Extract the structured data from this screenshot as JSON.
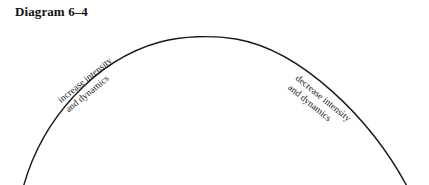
{
  "figure": {
    "title": "Diagram 6–4",
    "background_color": "#ffffff",
    "stroke_color": "#1a1a1a",
    "text_color": "#111111"
  },
  "arc": {
    "shape": "arch-curve",
    "left_end": {
      "x": 22,
      "y": 185
    },
    "apex": {
      "x": 216,
      "y": 37
    },
    "right_end": {
      "x": 410,
      "y": 185
    },
    "stroke_width": 1.4
  },
  "labels": {
    "left": {
      "name": "increase-label",
      "line1": "increase intensity",
      "line2": "and dynamics",
      "rotation_deg": -39
    },
    "right": {
      "name": "decrease-label",
      "line1": "decrease intensity",
      "line2": "and dynamics",
      "rotation_deg": 39
    }
  }
}
